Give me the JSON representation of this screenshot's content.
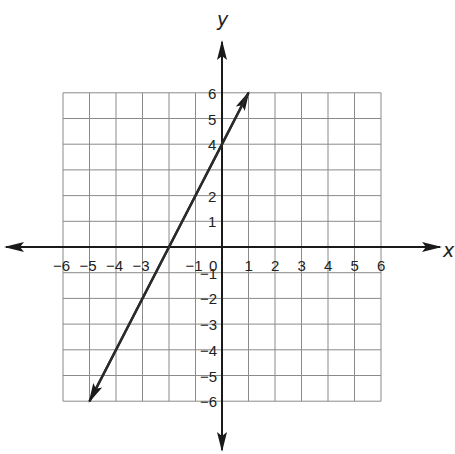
{
  "chart_data": {
    "type": "line",
    "title": "",
    "xlabel": "x",
    "ylabel": "y",
    "xlim": [
      -6,
      6
    ],
    "ylim": [
      -6,
      6
    ],
    "grid": true,
    "x_ticks": [
      -6,
      -5,
      -4,
      -3,
      -1,
      0,
      1,
      2,
      3,
      4,
      5,
      6
    ],
    "y_ticks": [
      6,
      5,
      4,
      2,
      1,
      -1,
      -2,
      -3,
      -4,
      -5,
      -6
    ],
    "x_tick_labels": [
      "−6",
      "−5",
      "−4",
      "−3",
      "−1",
      "0",
      "1",
      "2",
      "3",
      "4",
      "5",
      "6"
    ],
    "y_tick_labels": [
      "6",
      "5",
      "4",
      "2",
      "1",
      "−1",
      "−2",
      "−3",
      "−4",
      "−5",
      "−6"
    ],
    "series": [
      {
        "name": "y = 2x + 4",
        "x": [
          -5,
          -2,
          0,
          1
        ],
        "y": [
          -6,
          0,
          4,
          6
        ],
        "arrows_both_ends": true
      }
    ],
    "colors": {
      "grid": "#8a8a8a",
      "axis": "#1a1a1a",
      "line": "#2a2a2a"
    }
  }
}
